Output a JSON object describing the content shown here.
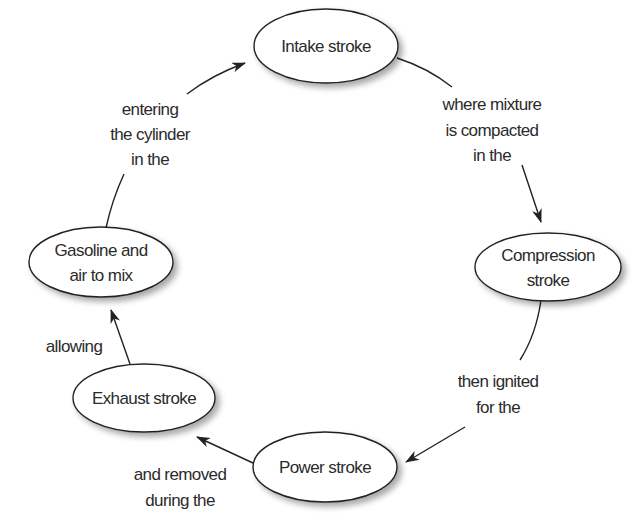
{
  "diagram": {
    "type": "cycle",
    "colors": {
      "stroke": "#222222",
      "text": "#2b2b2b",
      "node_fill": "#ffffff",
      "background": "#ffffff"
    },
    "nodes": [
      {
        "id": "intake",
        "lines": [
          "Intake stroke"
        ],
        "cx": 326,
        "cy": 46,
        "rx": 72,
        "ry": 37
      },
      {
        "id": "compression",
        "lines": [
          "Compression",
          "stroke"
        ],
        "cx": 548,
        "cy": 267,
        "rx": 73,
        "ry": 34
      },
      {
        "id": "power",
        "lines": [
          "Power stroke"
        ],
        "cx": 325,
        "cy": 467,
        "rx": 72,
        "ry": 35
      },
      {
        "id": "exhaust",
        "lines": [
          "Exhaust stroke"
        ],
        "cx": 144,
        "cy": 398,
        "rx": 71,
        "ry": 34
      },
      {
        "id": "gasoline",
        "lines": [
          "Gasoline and",
          "air to mix"
        ],
        "cx": 101,
        "cy": 262,
        "rx": 72,
        "ry": 35
      }
    ],
    "edges": [
      {
        "from": "intake",
        "to": "compression",
        "label_lines": [
          "where mixture",
          "is compacted",
          "in the"
        ]
      },
      {
        "from": "compression",
        "to": "power",
        "label_lines": [
          "then ignited",
          "for the"
        ]
      },
      {
        "from": "power",
        "to": "exhaust",
        "label_lines": [
          "and removed",
          "during the"
        ]
      },
      {
        "from": "exhaust",
        "to": "gasoline",
        "label_lines": [
          "allowing"
        ]
      },
      {
        "from": "gasoline",
        "to": "intake",
        "label_lines": [
          "entering",
          "the cylinder",
          "in the"
        ]
      }
    ]
  },
  "nodes": {
    "intake": {
      "line1": "Intake stroke"
    },
    "compression": {
      "line1": "Compression",
      "line2": "stroke"
    },
    "power": {
      "line1": "Power stroke"
    },
    "exhaust": {
      "line1": "Exhaust stroke"
    },
    "gasoline": {
      "line1": "Gasoline and",
      "line2": "air to mix"
    }
  },
  "edge_labels": {
    "intake_to_compression": {
      "line1": "where mixture",
      "line2": "is compacted",
      "line3": "in the"
    },
    "compression_to_power": {
      "line1": "then ignited",
      "line2": "for the"
    },
    "power_to_exhaust": {
      "line1": "and removed",
      "line2": "during the"
    },
    "exhaust_to_gasoline": {
      "line1": "allowing"
    },
    "gasoline_to_intake": {
      "line1": "entering",
      "line2": "the cylinder",
      "line3": "in the"
    }
  }
}
